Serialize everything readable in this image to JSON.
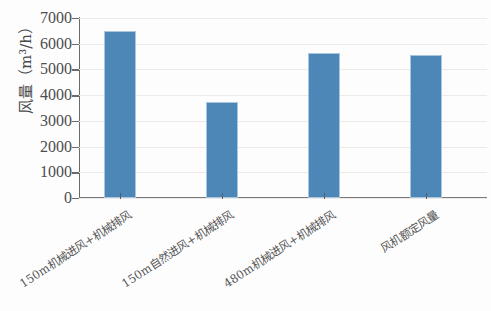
{
  "chart_data": {
    "type": "bar",
    "title": "",
    "subtitle": "",
    "xlabel": "",
    "ylabel": "风量（m³/h）",
    "categories": [
      "150m机械进风+机械排风",
      "150m自然进风+机械排风",
      "480m机械进风+机械排风",
      "风机额定风量"
    ],
    "values": [
      6500,
      3750,
      5650,
      5570
    ],
    "ylim": [
      0,
      7000
    ],
    "ytick_labels": [
      "7000",
      "6000",
      "5000",
      "4000",
      "3000",
      "2000",
      "1000",
      "0"
    ],
    "ytick_values": [
      7000,
      6000,
      5000,
      4000,
      3000,
      2000,
      1000,
      0
    ],
    "grid": true,
    "legend": false,
    "legend_position": "none",
    "bar_color": "#4d87b8",
    "bar_edge_color": "#a9c6dd",
    "grid_color": "#eeeaea",
    "axis_color": "#6a6a6a",
    "text_color": "#4d4d4d",
    "background_color": "#fdfdfd",
    "xlabel_rotation_deg": -33
  }
}
